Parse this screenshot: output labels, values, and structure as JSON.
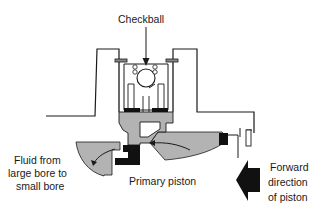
{
  "diagram": {
    "type": "cutaway",
    "labels": {
      "checkball": "Checkball",
      "fluid_line1": "Fluid from",
      "fluid_line2": "large bore to",
      "fluid_line3": "small bore",
      "primary_piston": "Primary piston",
      "forward_line1": "Forward",
      "forward_line2": "direction",
      "forward_line3": "of piston"
    },
    "colors": {
      "fluid": "#b3b3b3",
      "outline": "#1a1a1a",
      "seal": "#111111",
      "background": "#ffffff"
    }
  }
}
